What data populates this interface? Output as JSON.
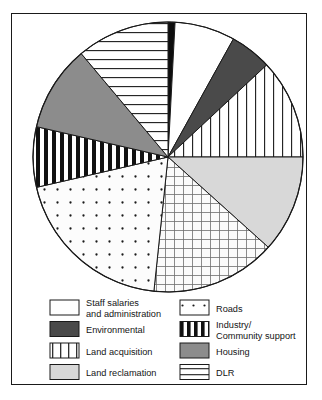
{
  "chart_data": {
    "type": "pie",
    "title": "",
    "categories": [
      "Promotion/Publicity",
      "Staff salaries and administration",
      "Environmental",
      "Land acquisition",
      "Land reclamation",
      "Utilities",
      "Roads",
      "Industry/Community support",
      "Housing",
      "DLR"
    ],
    "values": [
      0.8,
      7.2,
      5.0,
      11.9,
      11.7,
      15.0,
      19.7,
      7.2,
      10.3,
      11.2
    ],
    "units": "percent",
    "start_angle_deg": 0,
    "direction": "clockwise",
    "legend": "bottom",
    "grid": false,
    "slices": [
      {
        "name": "Promotion/Publicity",
        "start_deg": 0,
        "end_deg": 3,
        "value": 0.8,
        "fill": "#0d0d0d",
        "pattern": "solid-black"
      },
      {
        "name": "Staff salaries and administration",
        "start_deg": 3,
        "end_deg": 29,
        "value": 7.2,
        "fill": "#ffffff",
        "pattern": "plain-white"
      },
      {
        "name": "Environmental",
        "start_deg": 29,
        "end_deg": 47,
        "value": 5.0,
        "fill": "#4a4a4a",
        "pattern": "solid-dark-grey"
      },
      {
        "name": "Land acquisition",
        "start_deg": 47,
        "end_deg": 90,
        "value": 11.9,
        "fill": "#ffffff",
        "pattern": "vertical-lines"
      },
      {
        "name": "Land reclamation",
        "start_deg": 90,
        "end_deg": 132,
        "value": 11.7,
        "fill": "#d8d8d8",
        "pattern": "solid-light-grey"
      },
      {
        "name": "Utilities",
        "start_deg": 132,
        "end_deg": 186,
        "value": 15.0,
        "fill": "#ffffff",
        "pattern": "grid"
      },
      {
        "name": "Roads",
        "start_deg": 186,
        "end_deg": 257,
        "value": 19.7,
        "fill": "#ffffff",
        "pattern": "dots"
      },
      {
        "name": "Industry/Community support",
        "start_deg": 257,
        "end_deg": 283,
        "value": 7.2,
        "fill": "#ffffff",
        "pattern": "bold-vertical-bars"
      },
      {
        "name": "Housing",
        "start_deg": 283,
        "end_deg": 320,
        "value": 10.3,
        "fill": "#8c8c8c",
        "pattern": "solid-mid-grey"
      },
      {
        "name": "DLR",
        "start_deg": 320,
        "end_deg": 360,
        "value": 11.2,
        "fill": "#ffffff",
        "pattern": "horizontal-lines"
      }
    ]
  },
  "legend": {
    "left_column": [
      {
        "label_line1": "Staff salaries",
        "label_line2": "and administration",
        "pattern": "plain-white"
      },
      {
        "label_line1": "Environmental",
        "label_line2": "",
        "pattern": "solid-dark-grey"
      },
      {
        "label_line1": "Land acquisition",
        "label_line2": "",
        "pattern": "vertical-lines"
      },
      {
        "label_line1": "Land reclamation",
        "label_line2": "",
        "pattern": "solid-light-grey"
      },
      {
        "label_line1": "Utilities",
        "label_line2": "",
        "pattern": "grid"
      }
    ],
    "right_column": [
      {
        "label_line1": "Roads",
        "label_line2": "",
        "pattern": "dots"
      },
      {
        "label_line1": "Industry/",
        "label_line2": "Community support",
        "pattern": "bold-vertical-bars"
      },
      {
        "label_line1": "Housing",
        "label_line2": "",
        "pattern": "solid-mid-grey"
      },
      {
        "label_line1": "DLR",
        "label_line2": "",
        "pattern": "horizontal-lines"
      },
      {
        "label_line1": "Promotion/Publicity",
        "label_line2": "",
        "pattern": "solid-black"
      }
    ]
  },
  "colors": {
    "outline": "#1a1a1a",
    "dark_grey": "#4a4a4a",
    "mid_grey": "#8c8c8c",
    "light_grey": "#d8d8d8",
    "black": "#0d0d0d",
    "white": "#ffffff"
  }
}
